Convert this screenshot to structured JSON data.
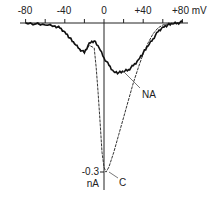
{
  "chart_data": {
    "type": "line",
    "title": "",
    "xlabel": "mV",
    "ylabel": "nA",
    "xlim": [
      -80,
      80
    ],
    "ylim": [
      -0.3,
      0
    ],
    "x_ticks": [
      -80,
      -60,
      -40,
      -20,
      0,
      20,
      40,
      60,
      80
    ],
    "x_tick_labels": [
      "-80",
      "-40",
      "0",
      "+40",
      "+80 mV"
    ],
    "y_tick_labels": [
      "-0.3",
      "nA"
    ],
    "grid": false,
    "series": [
      {
        "name": "NA",
        "x": [
          -80,
          -70,
          -60,
          -50,
          -45,
          -40,
          -35,
          -30,
          -25,
          -20,
          -15,
          -10,
          -5,
          0,
          5,
          10,
          15,
          20,
          25,
          30,
          35,
          40,
          45,
          50,
          55,
          60,
          65,
          70,
          75,
          80
        ],
        "y": [
          0.0,
          -0.002,
          -0.004,
          -0.006,
          -0.01,
          -0.018,
          -0.03,
          -0.042,
          -0.052,
          -0.06,
          -0.04,
          -0.036,
          -0.05,
          -0.07,
          -0.085,
          -0.098,
          -0.1,
          -0.098,
          -0.094,
          -0.086,
          -0.074,
          -0.06,
          -0.046,
          -0.032,
          -0.018,
          -0.008,
          -0.004,
          -0.002,
          0.0,
          0.002
        ]
      },
      {
        "name": "C",
        "x": [
          -80,
          -70,
          -60,
          -50,
          -45,
          -40,
          -35,
          -30,
          -25,
          -20,
          -15,
          -10,
          -8,
          -6,
          -4,
          -2,
          0,
          2,
          5,
          10,
          15,
          20,
          25,
          30,
          35,
          40,
          45,
          50,
          55,
          60,
          65,
          70,
          75,
          80
        ],
        "y": [
          0.0,
          -0.002,
          -0.004,
          -0.006,
          -0.01,
          -0.018,
          -0.03,
          -0.042,
          -0.052,
          -0.06,
          -0.045,
          -0.05,
          -0.09,
          -0.14,
          -0.2,
          -0.26,
          -0.29,
          -0.3,
          -0.29,
          -0.26,
          -0.225,
          -0.19,
          -0.155,
          -0.12,
          -0.09,
          -0.062,
          -0.04,
          -0.022,
          -0.01,
          -0.004,
          -0.002,
          0.0,
          0.0,
          0.002
        ]
      }
    ],
    "annotations": [
      {
        "text": "NA",
        "target_series": "NA"
      },
      {
        "text": "C",
        "target_series": "C"
      }
    ]
  },
  "labels": {
    "x_ticks": [
      "-80",
      "-40",
      "0",
      "+40",
      "+80 mV"
    ],
    "y_value": "-0.3",
    "y_unit": "nA",
    "series_na": "NA",
    "series_c": "C"
  }
}
